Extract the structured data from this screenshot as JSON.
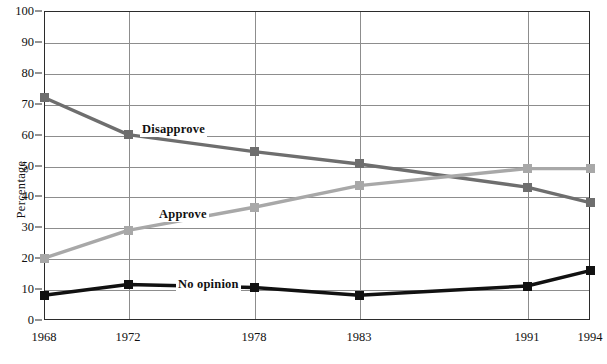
{
  "chart_data": {
    "type": "line",
    "title": "",
    "subtitle": "",
    "xlabel": "",
    "ylabel": "Percentage",
    "x": [
      1968,
      1972,
      1978,
      1983,
      1991,
      1994
    ],
    "categories": [
      "1968",
      "1972",
      "1978",
      "1983",
      "1991",
      "1994"
    ],
    "xtick_labels": [
      "1968",
      "1972",
      "1978",
      "1983",
      "1991",
      "1994"
    ],
    "ytick_labels": [
      "0",
      "10",
      "20",
      "30",
      "40",
      "50",
      "60",
      "70",
      "80",
      "90",
      "100"
    ],
    "yticks": [
      0,
      10,
      20,
      30,
      40,
      50,
      60,
      70,
      80,
      90,
      100
    ],
    "ylim": [
      0,
      100
    ],
    "xlim": [
      1968,
      1994
    ],
    "grid": true,
    "legend": "inline-series-labels",
    "marker": "square",
    "series": [
      {
        "name": "Disapprove",
        "color": "#6e6e6e",
        "values": [
          72,
          60,
          54.5,
          50.5,
          43,
          38
        ]
      },
      {
        "name": "Approve",
        "color": "#a8a8a8",
        "values": [
          20,
          29,
          36.5,
          43.5,
          49,
          49
        ]
      },
      {
        "name": "No opinion",
        "color": "#111111",
        "values": [
          8,
          11.5,
          10.5,
          8,
          11,
          16
        ]
      }
    ],
    "annotations": [
      {
        "text": "Disapprove",
        "x_px": 140,
        "y_px": 122
      },
      {
        "text": "Approve",
        "x_px": 157,
        "y_px": 207
      },
      {
        "text": "No opinion",
        "x_px": 176,
        "y_px": 277
      }
    ]
  },
  "colors": {
    "disapprove": "#6e6e6e",
    "approve": "#a8a8a8",
    "no_opinion": "#111111",
    "grid": "#8d8d8d",
    "frame": "#2b2b2b",
    "background": "#ffffff"
  }
}
